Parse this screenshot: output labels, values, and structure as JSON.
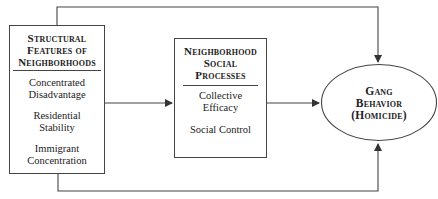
{
  "structural_box": {
    "title_lines": [
      "Structural",
      "Features of",
      "Neighborhoods"
    ],
    "items": [
      [
        "Concentrated",
        "Disadvantage"
      ],
      [
        "Residential",
        "Stability"
      ],
      [
        "Immigrant",
        "Concentration"
      ]
    ]
  },
  "process_box": {
    "title_lines": [
      "Neighborhood",
      "Social",
      "Processes"
    ],
    "items": [
      [
        "Collective",
        "Efficacy"
      ],
      [
        "Social Control"
      ]
    ]
  },
  "outcome": {
    "title_lines": [
      "Gang",
      "Behavior",
      "(Homicide)"
    ]
  },
  "colors": {
    "line": "#444444",
    "background": "#ffffff"
  }
}
